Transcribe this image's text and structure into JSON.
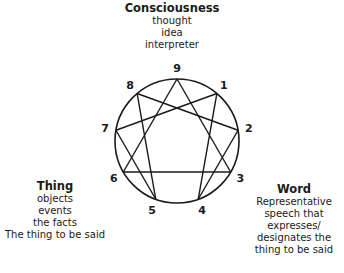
{
  "diagram": {
    "type": "enneagram",
    "center": [
      177,
      141
    ],
    "radius": 62,
    "points": [
      {
        "label": "9",
        "angle": 0
      },
      {
        "label": "1",
        "angle": 40
      },
      {
        "label": "2",
        "angle": 80
      },
      {
        "label": "3",
        "angle": 120
      },
      {
        "label": "4",
        "angle": 160
      },
      {
        "label": "5",
        "angle": 200
      },
      {
        "label": "6",
        "angle": 240
      },
      {
        "label": "7",
        "angle": 280
      },
      {
        "label": "8",
        "angle": 320
      }
    ],
    "triangle": [
      "9",
      "3",
      "6"
    ],
    "hexad": [
      "1",
      "4",
      "2",
      "8",
      "5",
      "7"
    ]
  },
  "top": {
    "title": "Consciousness",
    "lines": [
      "thought",
      "idea",
      "interpreter"
    ]
  },
  "left": {
    "title": "Thing",
    "lines": [
      "objects",
      "events",
      "the facts",
      "The thing to be said"
    ]
  },
  "right": {
    "title": "Word",
    "lines": [
      "Representative",
      "speech that",
      "expresses/",
      "designates the",
      "thing to be said"
    ]
  }
}
